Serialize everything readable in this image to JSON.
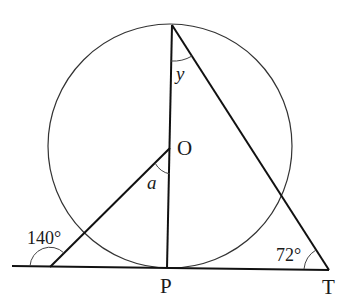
{
  "diagram": {
    "type": "circle-geometry",
    "points": {
      "top": {
        "label": "",
        "x": 172,
        "y": 25
      },
      "O": {
        "label": "O",
        "x": 170,
        "y": 148
      },
      "P": {
        "label": "P",
        "x": 167,
        "y": 268
      },
      "T": {
        "label": "T",
        "x": 329,
        "y": 270
      },
      "L": {
        "label": "",
        "x": 50,
        "y": 267
      }
    },
    "circle": {
      "cx": 170,
      "cy": 146,
      "r": 122
    },
    "labels": {
      "O": "O",
      "P": "P",
      "T": "T",
      "angle_y": "y",
      "angle_a": "a",
      "angle_140": "140°",
      "angle_72": "72°"
    },
    "angles": [
      {
        "name": "exterior angle at tangent-line left point",
        "value": "140°"
      },
      {
        "name": "angle at T",
        "value": "72°"
      },
      {
        "name": "angle at top vertex",
        "value": "y"
      },
      {
        "name": "angle at O between OP and OL",
        "value": "a"
      }
    ],
    "colors": {
      "line": "#111111",
      "circle": "#333333",
      "background": "#ffffff"
    }
  }
}
